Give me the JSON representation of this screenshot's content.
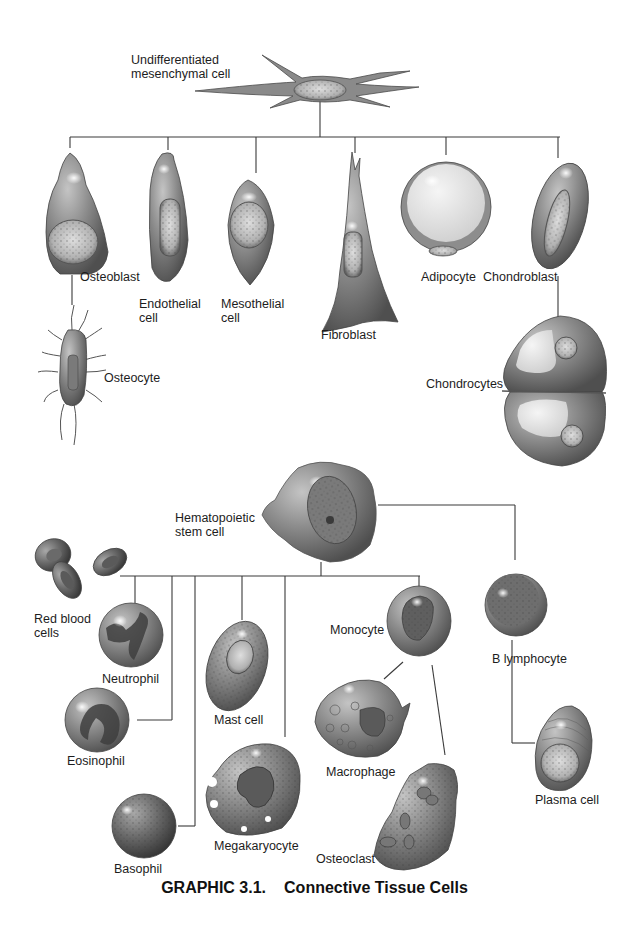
{
  "figure": {
    "caption_number": "GRAPHIC 3.1.",
    "caption_title": "Connective Tissue Cells",
    "colors": {
      "cell_body": "#8c8c8c",
      "cell_dark": "#5e5e5e",
      "nucleus": "#b9b9b9",
      "lines": "#3a3a3a",
      "background": "#ffffff"
    }
  },
  "mesenchymal_lineage": {
    "root": {
      "label_line1": "Undifferentiated",
      "label_line2": "mesenchymal cell"
    },
    "children": [
      {
        "id": "osteoblast",
        "label": "Osteoblast"
      },
      {
        "id": "endothelial",
        "label_line1": "Endothelial",
        "label_line2": "cell"
      },
      {
        "id": "mesothelial",
        "label_line1": "Mesothelial",
        "label_line2": "cell"
      },
      {
        "id": "fibroblast",
        "label": "Fibroblast"
      },
      {
        "id": "adipocyte",
        "label": "Adipocyte"
      },
      {
        "id": "chondroblast",
        "label": "Chondroblast"
      }
    ],
    "derived": [
      {
        "id": "osteocyte",
        "from": "osteoblast",
        "label": "Osteocyte"
      },
      {
        "id": "chondrocytes",
        "from": "chondroblast",
        "label": "Chondrocytes"
      }
    ]
  },
  "hematopoietic_lineage": {
    "root": {
      "label_line1": "Hematopoietic",
      "label_line2": "stem cell"
    },
    "children": [
      {
        "id": "rbc",
        "label_line1": "Red blood",
        "label_line2": "cells"
      },
      {
        "id": "neutrophil",
        "label": "Neutrophil"
      },
      {
        "id": "eosinophil",
        "label": "Eosinophil"
      },
      {
        "id": "basophil",
        "label": "Basophil"
      },
      {
        "id": "mast",
        "label": "Mast cell"
      },
      {
        "id": "megakaryocyte",
        "label": "Megakaryocyte"
      },
      {
        "id": "monocyte",
        "label": "Monocyte"
      },
      {
        "id": "b_lymphocyte",
        "label": "B lymphocyte"
      }
    ],
    "derived": [
      {
        "id": "macrophage",
        "from": "monocyte",
        "label": "Macrophage"
      },
      {
        "id": "osteoclast",
        "from": "monocyte",
        "label": "Osteoclast"
      },
      {
        "id": "plasma",
        "from": "b_lymphocyte",
        "label": "Plasma cell"
      }
    ]
  }
}
